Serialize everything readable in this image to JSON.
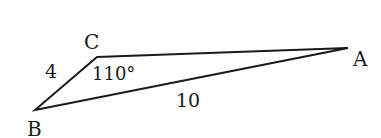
{
  "diagram": {
    "type": "triangle",
    "vertices": [
      {
        "label": "A",
        "x": 348,
        "y": 48
      },
      {
        "label": "B",
        "x": 35,
        "y": 110
      },
      {
        "label": "C",
        "x": 97,
        "y": 57
      }
    ],
    "sides": {
      "BC": "4",
      "AB": "10"
    },
    "angles": {
      "C": "110°"
    },
    "stroke_color": "#1a1a1a"
  }
}
